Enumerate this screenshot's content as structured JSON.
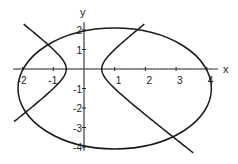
{
  "chart_data": {
    "type": "line",
    "title": "",
    "xlabel": "x",
    "ylabel": "y",
    "xlim": [
      -2.3,
      4.3
    ],
    "ylim": [
      -4.2,
      2.3
    ],
    "grid": false,
    "legend": null,
    "x_ticks": [
      -2,
      -1,
      1,
      2,
      3,
      4
    ],
    "x_tick_labels": [
      "-2",
      "-1",
      "1",
      "2",
      "3",
      "4"
    ],
    "y_ticks": [
      2,
      1,
      -1,
      -2,
      -3,
      -4
    ],
    "y_tick_labels": [
      "2",
      "1",
      "-1",
      "-2",
      "-3",
      "-4"
    ],
    "series": [
      {
        "name": "ellipse",
        "kind": "ellipse",
        "center": [
          1,
          -1
        ],
        "semi_axes": [
          3.15,
          3.1
        ],
        "color": "#1a1a1a"
      },
      {
        "name": "hyperbola",
        "kind": "hyperbola",
        "equation": "3x^2 - 2y^2 = 1",
        "vertices": [
          [
            -0.577,
            0
          ],
          [
            0.577,
            0
          ]
        ],
        "branches": [
          {
            "name": "left",
            "y_range": [
              -2.7,
              2.3
            ]
          },
          {
            "name": "right",
            "y_range": [
              -4.3,
              2.3
            ]
          }
        ],
        "color": "#1a1a1a"
      }
    ],
    "intersections_approx": [
      [
        -1.2,
        1.4
      ],
      [
        1.8,
        2.0
      ],
      [
        -2.0,
        -2.2
      ],
      [
        2.9,
        -3.5
      ]
    ]
  },
  "axes": {
    "x_label": "x",
    "y_label": "y"
  }
}
